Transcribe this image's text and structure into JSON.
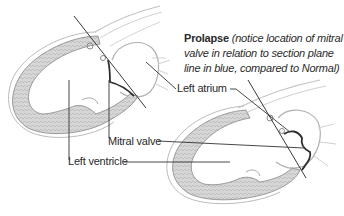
{
  "diagram": {
    "caption": {
      "title": "Prolapse",
      "note": "(notice location of mitral valve in relation to section plane line in blue, compared to Normal)"
    },
    "labels": {
      "left_atrium": "Left atrium",
      "mitral_valve": "Mitral valve",
      "left_ventricle": "Left ventricle"
    },
    "figures": [
      {
        "name": "Normal",
        "position": "top-left"
      },
      {
        "name": "Prolapse",
        "position": "bottom-right"
      }
    ],
    "colors": {
      "myocardium_fill": "#d4d4d4",
      "myocardium_texture": "#b8b8b8",
      "outline": "#9a9a9a",
      "section_line": "#3a3a3a",
      "valve": "#2e2e2e",
      "leader": "#333333",
      "text": "#2a2a2a"
    }
  }
}
